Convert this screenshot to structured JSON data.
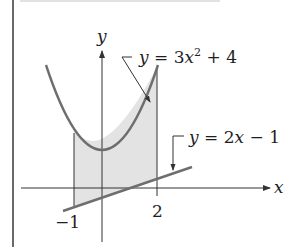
{
  "figure": {
    "type": "area-between-curves",
    "axes": {
      "x_label": "x",
      "y_label": "y",
      "x_ticks": [
        {
          "value": -1,
          "label": "−1"
        },
        {
          "value": 2,
          "label": "2"
        }
      ]
    },
    "curves": [
      {
        "name": "upper",
        "equation_lhs": "y",
        "equation_rhs_coef": "3x",
        "equation_rhs_exp": "2",
        "equation_rhs_rest": " + 4",
        "full": "y = 3x² + 4"
      },
      {
        "name": "lower",
        "equation_lhs": "y",
        "equation_rhs": "2x − 1",
        "full": "y = 2x − 1"
      }
    ],
    "shaded_region": {
      "x_from": -1,
      "x_to": 2,
      "between": [
        "y = 3x² + 4",
        "y = 2x − 1"
      ]
    },
    "colors": {
      "curve": "#6e6e6e",
      "axis": "#333333",
      "shade": "#e3e3e3",
      "frame": "#444444"
    }
  },
  "labels": {
    "y_axis": "y",
    "x_axis": "x",
    "tick_neg1": "−1",
    "tick_2": "2",
    "parabola_eq_y": "y",
    "parabola_eq_eq": " = 3",
    "parabola_eq_x": "x",
    "parabola_eq_exp": "2",
    "parabola_eq_rest": " + 4",
    "line_eq_y": "y",
    "line_eq_eq": " = 2",
    "line_eq_x": "x",
    "line_eq_rest": " − 1"
  }
}
